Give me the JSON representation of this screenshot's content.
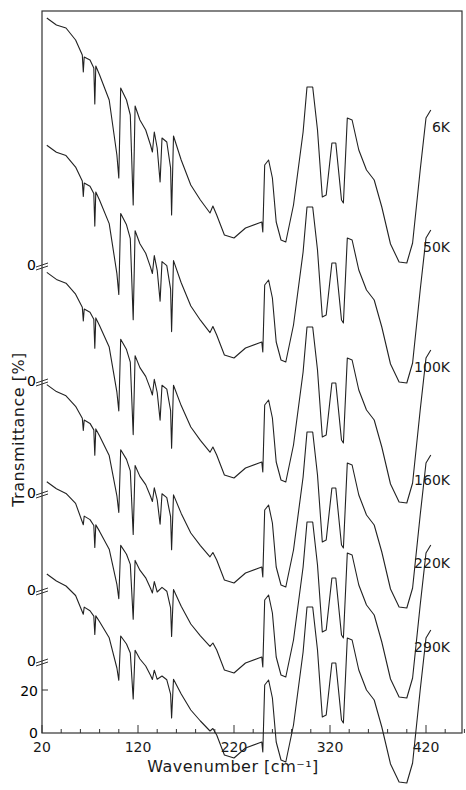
{
  "chart_data": {
    "type": "line",
    "title": "",
    "xlabel": "Wavenumber  [cm⁻¹]",
    "ylabel": "Transmittance  [%]",
    "xlim": [
      20,
      460
    ],
    "x_ticks": [
      20,
      120,
      220,
      320,
      420
    ],
    "x_minor_step": 20,
    "y_ticks_bottom": [
      0,
      20
    ],
    "offset_zero_marks": [
      "0",
      "0",
      "0",
      "0",
      "0"
    ],
    "grid": false,
    "legend_position": "right, inline labels at curve ends",
    "series": [
      {
        "name": "6K",
        "label_y": 132,
        "offset": 0
      },
      {
        "name": "50K",
        "label_y": 252,
        "offset": 120
      },
      {
        "name": "100K",
        "label_y": 372,
        "offset": 240
      },
      {
        "name": "160K",
        "label_y": 485,
        "offset": 345
      },
      {
        "name": "220K",
        "label_y": 568,
        "offset": 435
      },
      {
        "name": "290K",
        "label_y": 652,
        "offset": 520
      }
    ],
    "features_cm-1": {
      "sharp_absorptions": [
        63,
        75,
        100,
        115,
        135,
        140,
        155
      ],
      "broad_absorptions": [
        215,
        250,
        275,
        320,
        340,
        405
      ],
      "transmission_maxima": [
        258,
        305,
        330,
        350
      ]
    }
  },
  "axes": {
    "x_tick_labels": [
      "20",
      "120",
      "220",
      "320",
      "420"
    ],
    "y_bottom_labels": [
      "0",
      "20"
    ],
    "y_offset_zero_label": "0"
  }
}
